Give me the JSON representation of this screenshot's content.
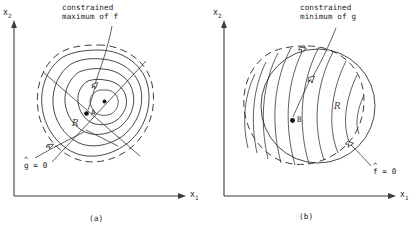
{
  "figure": {
    "type": "diagram",
    "background_color": "#ffffff",
    "line_color": "#262626"
  },
  "panels": [
    {
      "id": "a",
      "caption": "(a)",
      "axes": {
        "x_label": "x",
        "x_subscript": "1",
        "y_label": "x",
        "y_subscript": "2"
      },
      "callout": {
        "line1": "constrained",
        "line2": "maximum of f"
      },
      "constraint_label": {
        "symbol": "g",
        "hat": "^",
        "equals": " = 0",
        "full": "g = 0"
      },
      "region_label": "R",
      "point_label": "A",
      "contours": {
        "objective": "f",
        "style": "nested closed ovals with center dot",
        "count": 5,
        "constraint_boundary_style": "dashed"
      }
    },
    {
      "id": "b",
      "caption": "(b)",
      "axes": {
        "x_label": "x",
        "x_subscript": "1",
        "y_label": "x",
        "y_subscript": "2"
      },
      "callout": {
        "line1": "constrained",
        "line2": "minimum of g"
      },
      "constraint_label": {
        "symbol": "f",
        "hat": "^",
        "equals": " = 0",
        "full": "f = 0"
      },
      "region_label": "R",
      "point_label": "B",
      "contours": {
        "objective": "g",
        "style": "family of near-parallel open curves",
        "count": 9,
        "constraint_boundary_style": "dashed blob plus solid circle"
      }
    }
  ]
}
